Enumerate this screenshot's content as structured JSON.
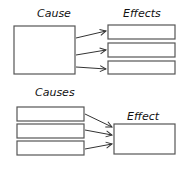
{
  "diagram": {
    "top": {
      "cause_label": "Cause",
      "effects_label": "Effects",
      "cause_boxes": 1,
      "effect_boxes": 3,
      "relation": "one cause to many effects"
    },
    "bottom": {
      "causes_label": "Causes",
      "effect_label": "Effect",
      "cause_boxes": 3,
      "effect_boxes": 1,
      "relation": "many causes to one effect"
    },
    "colors": {
      "box_stroke": "#555555",
      "arrow": "#333333",
      "text": "#111111",
      "background": "#ffffff"
    }
  }
}
